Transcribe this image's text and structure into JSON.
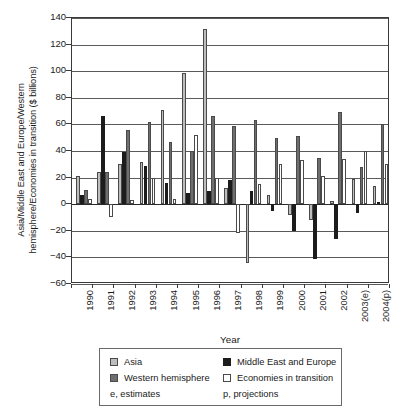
{
  "chart_data": {
    "type": "bar",
    "title": "",
    "xlabel": "Year",
    "ylabel": "Asia/Middle East and Europe/Western hemisphere/Economies in transition ($ billions)",
    "ylabel_line1": "Asia/Middle East and Europe/Western",
    "ylabel_line2": "hemisphere/Economies in transition ($ billions)",
    "ylim": [
      -60,
      140
    ],
    "yticks": [
      140,
      120,
      100,
      80,
      60,
      40,
      20,
      0,
      -20,
      -40,
      -60
    ],
    "ytick_labels": [
      "140",
      "120",
      "100",
      "80",
      "60",
      "40",
      "20",
      "0",
      "−20",
      "−40",
      "−60"
    ],
    "grid": true,
    "legend_position": "bottom",
    "categories": [
      "1990",
      "1991",
      "1992",
      "1993",
      "1994",
      "1995",
      "1996",
      "1997",
      "1998",
      "1999",
      "2000",
      "2001",
      "2002",
      "2003(e)",
      "2004(p)"
    ],
    "series": [
      {
        "name": "Asia",
        "color": "#bdbdbd",
        "values": [
          21,
          24,
          30,
          32,
          71,
          99,
          132,
          12,
          -44,
          7,
          -8,
          -12,
          2.5,
          19,
          14
        ]
      },
      {
        "name": "Middle East and Europe",
        "color": "#1c1c1c",
        "values": [
          7,
          66,
          39,
          29,
          16,
          8.5,
          10,
          18,
          10,
          -5,
          -20,
          -41,
          -26,
          -7,
          1.5
        ]
      },
      {
        "name": "Western hemisphere",
        "color": "#6e6e6e",
        "values": [
          11,
          24,
          56,
          62,
          47,
          40,
          66,
          59,
          63,
          50,
          51,
          35,
          69,
          28,
          60
        ]
      },
      {
        "name": "Economies in transition",
        "color": "#ffffff",
        "values": [
          4,
          -10,
          3.5,
          20,
          4,
          52,
          20,
          -22,
          15,
          30,
          33,
          21,
          34,
          40,
          30
        ]
      }
    ]
  },
  "legend": {
    "items": [
      {
        "label": "Asia",
        "swatch": "s0"
      },
      {
        "label": "Middle East and Europe",
        "swatch": "s1"
      },
      {
        "label": "Western hemisphere",
        "swatch": "s2"
      },
      {
        "label": "Economies in transition",
        "swatch": "s3"
      }
    ],
    "note_left": "e, estimates",
    "note_right": "p, projections"
  }
}
